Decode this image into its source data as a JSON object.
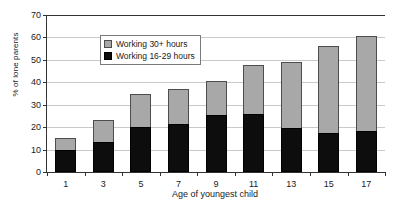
{
  "chart_data": {
    "type": "bar",
    "stacked": true,
    "title": "",
    "subtitle": "",
    "xlabel": "Age of youngest child",
    "ylabel": "% of lone parents",
    "categories": [
      "1",
      "3",
      "5",
      "7",
      "9",
      "11",
      "13",
      "15",
      "17"
    ],
    "series": [
      {
        "name": "Working 16-29 hours",
        "color": "#0d0d0d",
        "values": [
          9.8,
          13.4,
          20.0,
          21.6,
          25.4,
          26.0,
          19.7,
          17.3,
          18.2
        ]
      },
      {
        "name": "Working 30+ hours",
        "color": "#a8a8a8",
        "values": [
          5.3,
          9.8,
          14.8,
          15.3,
          15.1,
          21.5,
          29.4,
          38.9,
          42.4
        ]
      }
    ],
    "totals": [
      15.1,
      23.2,
      34.8,
      36.9,
      40.5,
      47.5,
      49.1,
      56.2,
      60.6
    ],
    "ylim": [
      0,
      70
    ],
    "yticks": [
      0,
      10,
      20,
      30,
      40,
      50,
      60,
      70
    ],
    "ytick_labels": [
      "0",
      "10",
      "20",
      "30",
      "40",
      "50",
      "60",
      "70"
    ],
    "grid": true,
    "grid_axis": "y",
    "legend_position": "upper left",
    "legend_entries": [
      "Working 30+ hours",
      "Working 16-29 hours"
    ]
  },
  "legend": {
    "items": [
      {
        "label": "Working 30+ hours",
        "swatch": "gray-swatch-icon"
      },
      {
        "label": "Working 16-29 hours",
        "swatch": "black-swatch-icon"
      }
    ]
  },
  "axes": {
    "y_title": "% of lone parents",
    "x_title": "Age of youngest child"
  }
}
